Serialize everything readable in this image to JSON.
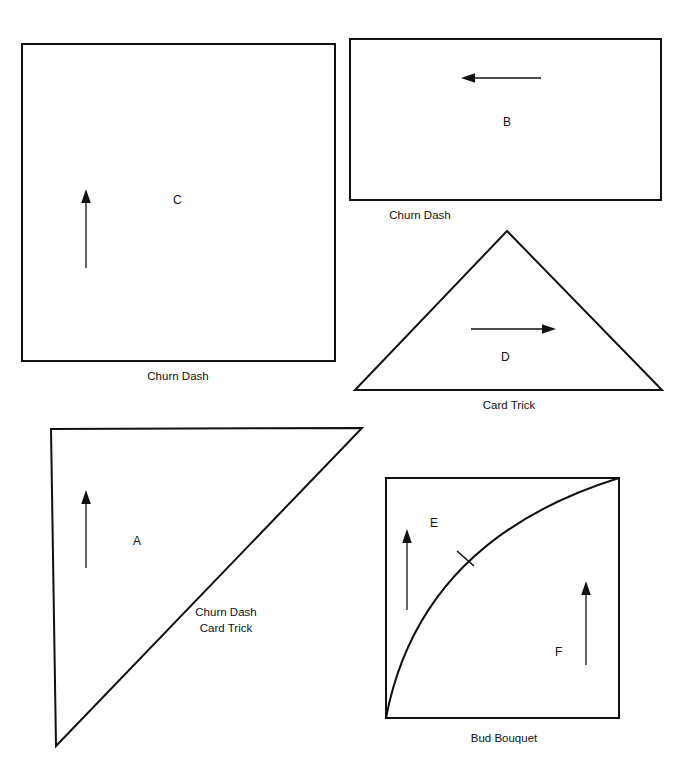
{
  "figure": {
    "background_color": "#ffffff",
    "line_color": "#111111",
    "width": 699,
    "height": 783
  },
  "shapes": {
    "c": {
      "letter": "C",
      "caption": "Churn Dash",
      "type": "square",
      "arrow_direction": "up"
    },
    "b": {
      "letter": "B",
      "caption": "Churn Dash",
      "type": "rectangle",
      "arrow_direction": "left"
    },
    "d": {
      "letter": "D",
      "caption": "Card Trick",
      "type": "triangle",
      "arrow_direction": "right"
    },
    "a": {
      "letter": "A",
      "caption_line1": "Churn Dash",
      "caption_line2": "Card Trick",
      "type": "right-triangle",
      "arrow_direction": "up"
    },
    "ef": {
      "letter_e": "E",
      "letter_f": "F",
      "caption": "Bud Bouquet",
      "type": "square-with-arc",
      "arrow_direction_e": "up",
      "arrow_direction_f": "up"
    }
  },
  "icons": {
    "arrow_up": "arrow-up-icon",
    "arrow_left": "arrow-left-icon",
    "arrow_right": "arrow-right-icon",
    "tick": "tick-mark-icon"
  }
}
